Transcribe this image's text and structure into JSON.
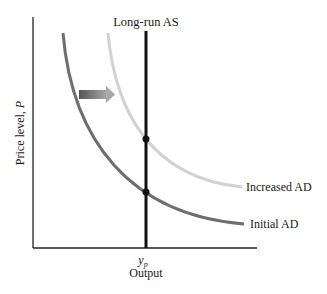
{
  "diagram": {
    "type": "aggregate-demand-shift",
    "lras_label": "Long-run AS",
    "y_axis_label": "Price level, ",
    "y_axis_symbol": "P",
    "x_axis_label": "Output",
    "x_tick_label": "y",
    "x_tick_sub": "p",
    "curves": [
      {
        "name": "Initial AD",
        "label": "Initial AD",
        "color": "#6e6e6e"
      },
      {
        "name": "Increased AD",
        "label": "Increased AD",
        "color": "#d0d0d0"
      }
    ],
    "shift_arrow": {
      "direction": "right",
      "color": "#6a6a6a"
    },
    "equilibria": [
      {
        "curve": "Increased AD",
        "at": "y_p"
      },
      {
        "curve": "Initial AD",
        "at": "y_p"
      }
    ]
  }
}
